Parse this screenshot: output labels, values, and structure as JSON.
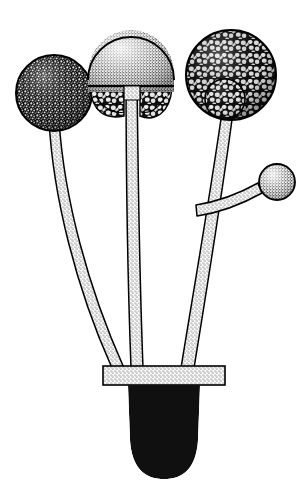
{
  "figure": {
    "style": "pen-and-ink stipple scientific illustration",
    "background_color": "#ffffff",
    "ink_color": "#000000",
    "width": 307,
    "height": 484
  },
  "palette": {
    "background": "#ffffff",
    "ink": "#000000",
    "stipple_light": "#d8d8d8",
    "stipple_mid": "#9a9a9a",
    "spore_dark": "#1a1a1a",
    "outline": "#000000"
  },
  "structures": {
    "sporangia": [
      {
        "name": "left-sporangium",
        "label": "mature dark sporangium",
        "cx": 54,
        "cy": 93,
        "r": 38,
        "texture": "dense-dark-granular",
        "fill": "#2b2b2b",
        "has_columella": false,
        "ruptured": false
      },
      {
        "name": "middle-sporangium",
        "label": "ruptured sporangium with columella and collarette",
        "cx": 131,
        "cy": 73,
        "r": 43,
        "texture": "fine-stipple-light",
        "fill": "#c9c9c9",
        "has_columella": true,
        "ruptured": true
      },
      {
        "name": "right-sporangium",
        "label": "sporangium with visible columella and coarse spore mass",
        "cx": 231,
        "cy": 75,
        "r": 45,
        "texture": "coarse-cobblestone",
        "fill": "#3a3a3a",
        "has_columella": true,
        "ruptured": false
      },
      {
        "name": "young-sporangium",
        "label": "small young sporangium on lateral branch",
        "cx": 277,
        "cy": 182,
        "r": 18,
        "texture": "fine-stipple-light",
        "fill": "#c9c9c9",
        "has_columella": false,
        "ruptured": false
      }
    ],
    "sporangiophores": [
      {
        "name": "left-sporangiophore",
        "label": "left stalk",
        "path": "M 54 129 C 58 200 80 290 117 366",
        "width": 9
      },
      {
        "name": "middle-sporangiophore",
        "label": "middle stalk",
        "path": "M 131 74 C 131 180 133 290 137 366",
        "width": 10
      },
      {
        "name": "right-sporangiophore",
        "label": "right stalk",
        "path": "M 228 118 C 215 200 198 290 186 366",
        "width": 11
      },
      {
        "name": "lateral-branch",
        "label": "side branch bearing young sporangium",
        "path": "M 196 212 C 225 206 248 196 263 188",
        "width": 8
      }
    ],
    "stolon": {
      "name": "stolon",
      "label": "horizontal stolon bar",
      "x": 103,
      "y": 366,
      "width": 122,
      "height": 19,
      "fill": "#d2d2d2"
    },
    "rhizoid": {
      "name": "rhizoid-mass",
      "label": "dense rhizoid root mass",
      "cx": 164,
      "top": 385,
      "bottom": 478,
      "half_width": 36,
      "hair_count": 210,
      "fill": "#0d0d0d"
    },
    "free_spores": {
      "name": "free-spores",
      "label": "released sporangiospores",
      "count": 8,
      "items": [
        {
          "cx": 100,
          "cy": 136,
          "rx": 7,
          "ry": 9,
          "rot": -12
        },
        {
          "cx": 118,
          "cy": 124,
          "rx": 7.5,
          "ry": 9.5,
          "rot": 8
        },
        {
          "cx": 112,
          "cy": 157,
          "rx": 7,
          "ry": 9,
          "rot": -6
        },
        {
          "cx": 147,
          "cy": 124,
          "rx": 7.5,
          "ry": 10,
          "rot": 10
        },
        {
          "cx": 168,
          "cy": 128,
          "rx": 7,
          "ry": 9,
          "rot": -8
        },
        {
          "cx": 152,
          "cy": 152,
          "rx": 7.5,
          "ry": 9.5,
          "rot": 6
        },
        {
          "cx": 176,
          "cy": 152,
          "rx": 7.5,
          "ry": 10,
          "rot": -10
        },
        {
          "cx": 132,
          "cy": 120,
          "rx": 6.5,
          "ry": 8.5,
          "rot": 14
        }
      ]
    }
  }
}
